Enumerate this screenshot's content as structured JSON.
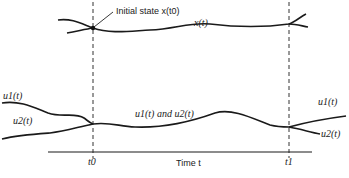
{
  "diagram": {
    "annotation_initial_state": "Initial state x(t0)",
    "label_x": "x(t)",
    "label_u1_left": "u1(t)",
    "label_u2_left": "u2(t)",
    "label_u1_u2_middle": "u1(t) and u2(t)",
    "label_u1_right": "u1(t)",
    "label_u2_right": "u2(t)",
    "axis_label": "Time t",
    "tick_t0": "t0",
    "tick_t1": "t1"
  }
}
